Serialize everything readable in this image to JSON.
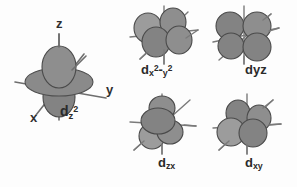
{
  "figure": {
    "background_color": "#fdfdfd",
    "lobe_color": "#8b8b8b",
    "axis_color": "#6e6e6e",
    "label_color": "#2b2b2b"
  },
  "orbitals": [
    {
      "id": "dz2",
      "label_main": "d",
      "label_sub": "z",
      "label_sup": "2",
      "label_text": "dz2",
      "shape": "two-lobes-with-torus",
      "axes": [
        {
          "name": "z",
          "label": "z"
        },
        {
          "name": "y",
          "label": "y"
        },
        {
          "name": "x",
          "label": "x"
        }
      ]
    },
    {
      "id": "dx2-y2",
      "label_main": "d",
      "label_sub": "x",
      "label_sup": "2",
      "label_sub2": "y",
      "label_sup2": "2",
      "label_text": "dx2-y2",
      "shape": "four-lobe-cloverleaf",
      "axes": []
    },
    {
      "id": "dyz",
      "label_main": "d",
      "label_sub": "yz",
      "label_text": "dyz",
      "shape": "four-lobe-cloverleaf",
      "axes": []
    },
    {
      "id": "dzx",
      "label_main": "d",
      "label_sub": "zx",
      "label_text": "dzx",
      "shape": "four-lobe-cloverleaf",
      "axes": []
    },
    {
      "id": "dxy",
      "label_main": "d",
      "label_sub": "xy",
      "label_text": "dxy",
      "shape": "four-lobe-cloverleaf",
      "axes": []
    }
  ]
}
